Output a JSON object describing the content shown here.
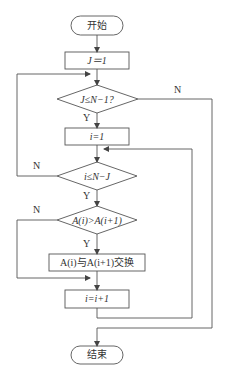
{
  "flowchart": {
    "nodes": {
      "start": {
        "label": "开始",
        "type": "terminal"
      },
      "init_j": {
        "label": "J＝1",
        "type": "process"
      },
      "cond_outer": {
        "label": "J≤N−1?",
        "type": "decision"
      },
      "init_i": {
        "label": "i=1",
        "type": "process"
      },
      "cond_inner": {
        "label": "i≤N−J",
        "type": "decision"
      },
      "cond_compare": {
        "label": "A(i)>A(i+1)",
        "type": "decision"
      },
      "swap": {
        "label": "A(i)与A(i+1)交换",
        "type": "process"
      },
      "inc_i": {
        "label": "i=i+1",
        "type": "process"
      },
      "end": {
        "label": "结束",
        "type": "terminal"
      }
    },
    "edge_labels": {
      "outer_yes": "Y",
      "outer_no": "N",
      "inner_yes": "Y",
      "inner_no": "N",
      "compare_yes": "Y",
      "compare_no": "N"
    },
    "colors": {
      "stroke": "#555555",
      "text": "#333333",
      "background": "#ffffff"
    }
  }
}
